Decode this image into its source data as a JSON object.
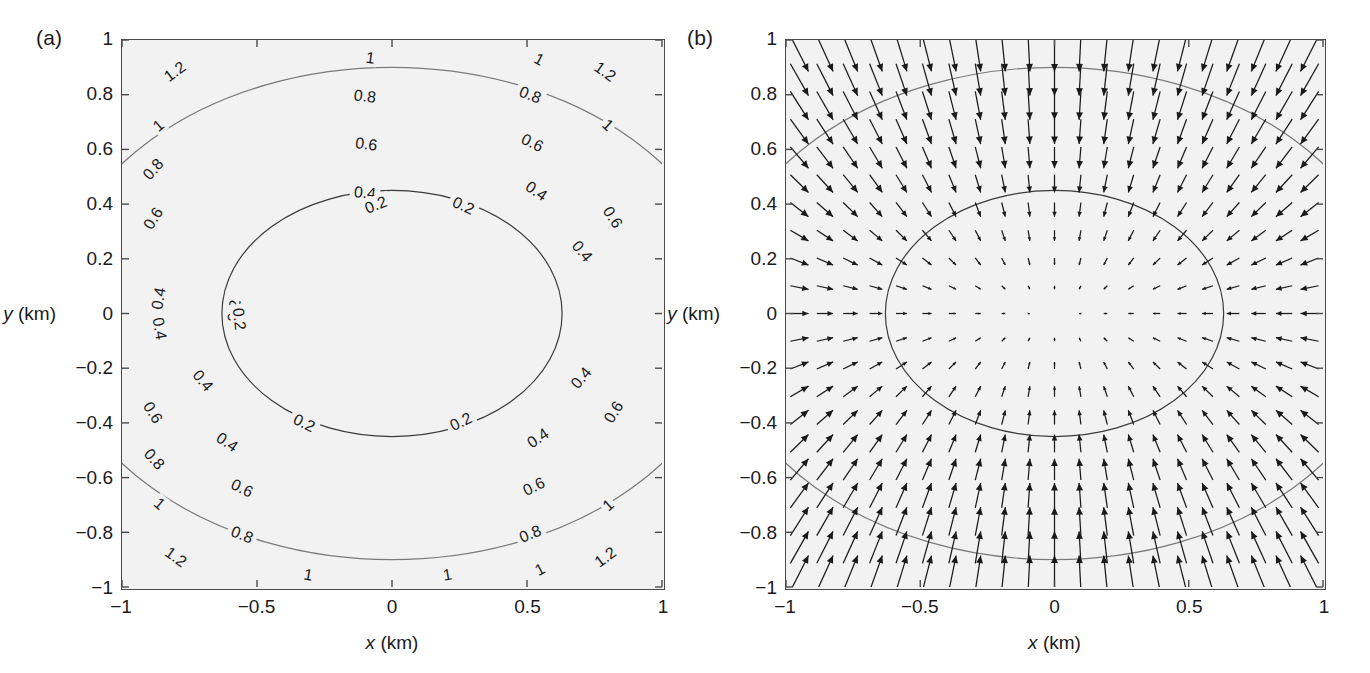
{
  "figure": {
    "width": 1370,
    "height": 673,
    "background": "#ffffff",
    "panel_face_color": "#f2f2f2",
    "axis_color": "#4a4a4a"
  },
  "panels": [
    {
      "tag": "(a)",
      "kind": "contour",
      "axes": {
        "xlabel_var": "x",
        "xlabel_unit": "(km)",
        "ylabel_var": "y",
        "ylabel_unit": "(km)",
        "xlim": [
          -1,
          1
        ],
        "ylim": [
          -1,
          1
        ],
        "xticks": [
          -1,
          -0.5,
          0,
          0.5,
          1
        ],
        "xticklabels": [
          "−1",
          "−0.5",
          "0",
          "0.5",
          "1"
        ],
        "yticks": [
          -1,
          -0.8,
          -0.6,
          -0.4,
          -0.2,
          0,
          0.2,
          0.4,
          0.6,
          0.8,
          1
        ],
        "yticklabels": [
          "−1",
          "−0.8",
          "−0.6",
          "−0.4",
          "−0.2",
          "0",
          "0.2",
          "0.4",
          "0.6",
          "0.8",
          "1"
        ],
        "grid": false
      }
    },
    {
      "tag": "(b)",
      "kind": "contour-with-quiver",
      "axes": {
        "xlabel_var": "x",
        "xlabel_unit": "(km)",
        "ylabel_var": "y",
        "ylabel_unit": "(km)",
        "xlim": [
          -1,
          1
        ],
        "ylim": [
          -1,
          1
        ],
        "xticks": [
          -1,
          -0.5,
          0,
          0.5,
          1
        ],
        "xticklabels": [
          "−1",
          "−0.5",
          "0",
          "0.5",
          "1"
        ],
        "yticks": [
          -1,
          -0.8,
          -0.6,
          -0.4,
          -0.2,
          0,
          0.2,
          0.4,
          0.6,
          0.8,
          1
        ],
        "yticklabels": [
          "−1",
          "−0.8",
          "−0.6",
          "−0.4",
          "−0.2",
          "0",
          "0.2",
          "0.4",
          "0.6",
          "0.8",
          "1"
        ],
        "grid": false
      }
    }
  ],
  "chart_data": {
    "type": "contour",
    "title": "",
    "xlabel": "x (km)",
    "ylabel": "y (km)",
    "xlim": [
      -1,
      1
    ],
    "ylim": [
      -1,
      1
    ],
    "field_model": {
      "description": "Elliptical scalar field rising from a minimum at the origin; contours are concentric ellipses wider in x than in y.",
      "formula": "z = sqrt((x/0.63)^2 + (y/0.45)^2) * 0.2",
      "x_semiaxis_per_level": 0.63,
      "y_semiaxis_per_level": 0.45
    },
    "levels": [
      0.2,
      0.4,
      0.6,
      0.8,
      1,
      1.2
    ],
    "level_labels": [
      "0.2",
      "0.4",
      "0.6",
      "0.8",
      "1",
      "1.2"
    ],
    "level_colors": [
      "#3a3a3a",
      "#7a7a7a",
      "#9a9a9a",
      "#a8a8a8",
      "#6a6a6a",
      "#2e2e2e"
    ],
    "contour_label_fontsize": 16,
    "panel_a_labels": [
      {
        "level": "1.2",
        "x": -0.805,
        "y": 0.885,
        "rot": -36
      },
      {
        "level": "1",
        "x": -0.865,
        "y": 0.688,
        "rot": -40
      },
      {
        "level": "0.8",
        "x": -0.885,
        "y": 0.528,
        "rot": -48
      },
      {
        "level": "0.6",
        "x": -0.885,
        "y": 0.348,
        "rot": -58
      },
      {
        "level": "0.4",
        "x": -0.865,
        "y": 0.055,
        "rot": -80
      },
      {
        "level": "0.2",
        "x": -0.585,
        "y": 0.01,
        "rot": -84
      },
      {
        "level": "1",
        "x": -0.08,
        "y": 0.935,
        "rot": 8
      },
      {
        "level": "0.8",
        "x": -0.1,
        "y": 0.795,
        "rot": 7
      },
      {
        "level": "0.6",
        "x": -0.095,
        "y": 0.62,
        "rot": 7
      },
      {
        "level": "0.4",
        "x": -0.1,
        "y": 0.442,
        "rot": 6
      },
      {
        "level": "0.2",
        "x": -0.06,
        "y": 0.398,
        "rot": -22
      },
      {
        "level": "1",
        "x": 0.545,
        "y": 0.93,
        "rot": 28
      },
      {
        "level": "1.2",
        "x": 0.79,
        "y": 0.885,
        "rot": 36
      },
      {
        "level": "0.8",
        "x": 0.512,
        "y": 0.8,
        "rot": 22
      },
      {
        "level": "1",
        "x": 0.8,
        "y": 0.69,
        "rot": 42
      },
      {
        "level": "0.6",
        "x": 0.52,
        "y": 0.625,
        "rot": 26
      },
      {
        "level": "0.6",
        "x": 0.818,
        "y": 0.352,
        "rot": 58
      },
      {
        "level": "0.4",
        "x": 0.535,
        "y": 0.448,
        "rot": 34
      },
      {
        "level": "0.2",
        "x": 0.265,
        "y": 0.395,
        "rot": 24
      },
      {
        "level": "0.4",
        "x": 0.705,
        "y": 0.228,
        "rot": 50
      },
      {
        "level": "0.2",
        "x": 0.255,
        "y": -0.395,
        "rot": -26
      },
      {
        "level": "0.4",
        "x": 0.7,
        "y": -0.235,
        "rot": -50
      },
      {
        "level": "0.6",
        "x": 0.82,
        "y": -0.36,
        "rot": -58
      },
      {
        "level": "0.4",
        "x": 0.54,
        "y": -0.455,
        "rot": -34
      },
      {
        "level": "0.6",
        "x": 0.525,
        "y": -0.632,
        "rot": -26
      },
      {
        "level": "0.8",
        "x": 0.512,
        "y": -0.805,
        "rot": -22
      },
      {
        "level": "1",
        "x": 0.548,
        "y": -0.935,
        "rot": -28
      },
      {
        "level": "1",
        "x": 0.8,
        "y": -0.7,
        "rot": -42
      },
      {
        "level": "1.2",
        "x": 0.79,
        "y": -0.89,
        "rot": -36
      },
      {
        "level": "0.2",
        "x": -0.565,
        "y": -0.02,
        "rot": 84
      },
      {
        "level": "0.4",
        "x": -0.86,
        "y": -0.055,
        "rot": 80
      },
      {
        "level": "0.6",
        "x": -0.885,
        "y": -0.362,
        "rot": 58
      },
      {
        "level": "0.4",
        "x": -0.7,
        "y": -0.245,
        "rot": 50
      },
      {
        "level": "0.2",
        "x": -0.325,
        "y": -0.4,
        "rot": 26
      },
      {
        "level": "0.4",
        "x": -0.61,
        "y": -0.47,
        "rot": 34
      },
      {
        "level": "0.8",
        "x": -0.88,
        "y": -0.532,
        "rot": 48
      },
      {
        "level": "0.6",
        "x": -0.555,
        "y": -0.638,
        "rot": 26
      },
      {
        "level": "1",
        "x": -0.86,
        "y": -0.695,
        "rot": 40
      },
      {
        "level": "0.8",
        "x": -0.555,
        "y": -0.808,
        "rot": 22
      },
      {
        "level": "1.2",
        "x": -0.8,
        "y": -0.89,
        "rot": 36
      },
      {
        "level": "1",
        "x": -0.31,
        "y": -0.955,
        "rot": 10
      },
      {
        "level": "1",
        "x": 0.205,
        "y": -0.955,
        "rot": -10
      }
    ],
    "quiver": {
      "description": "Gradient vector field of the elliptical scalar field, arrows directed toward the origin; magnitude grows with distance from the centre.",
      "grid_nx": 21,
      "grid_ny": 21,
      "x_range": [
        -0.95,
        0.95
      ],
      "y_range": [
        -0.95,
        0.95
      ],
      "arrow_color": "#1a1a1a",
      "max_arrow_length_px": 40
    }
  }
}
